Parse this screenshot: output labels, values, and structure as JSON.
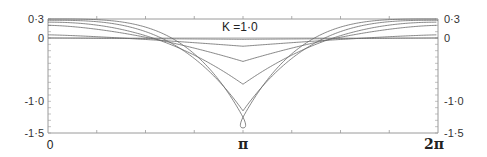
{
  "chart_data": {
    "type": "line",
    "title": "",
    "annotation": "K =1·0",
    "xlabel": "",
    "ylabel": "",
    "x_range": [
      0,
      6.2832
    ],
    "ylim": [
      -1.5,
      0.3
    ],
    "grid": false,
    "legend": "none",
    "x_ticks": [
      {
        "value": 0,
        "label": "0"
      },
      {
        "value": 3.1416,
        "label": "π"
      },
      {
        "value": 6.2832,
        "label": "2π"
      }
    ],
    "y_ticks_left": [
      {
        "value": 0.3,
        "label": "0·3"
      },
      {
        "value": 0,
        "label": "0"
      },
      {
        "value": -1.0,
        "label": "-1·0"
      },
      {
        "value": -1.5,
        "label": "-1·5"
      }
    ],
    "y_ticks_right": [
      {
        "value": 0.3,
        "label": "0·3"
      },
      {
        "value": 0,
        "label": "0"
      },
      {
        "value": -1.0,
        "label": "-1·0"
      },
      {
        "value": -1.5,
        "label": "-1·5"
      }
    ],
    "series": [
      {
        "name": "curve-1",
        "edge": 0.0,
        "center": -0.02,
        "sharpness": 1.0
      },
      {
        "name": "curve-2",
        "edge": 0.05,
        "center": -0.13,
        "sharpness": 1.3
      },
      {
        "name": "curve-3",
        "edge": 0.2,
        "center": -0.37,
        "sharpness": 1.6
      },
      {
        "name": "curve-4",
        "edge": 0.25,
        "center": -0.73,
        "sharpness": 2.2
      },
      {
        "name": "curve-5",
        "edge": 0.28,
        "center": -1.15,
        "sharpness": 3.0
      },
      {
        "name": "curve-6",
        "edge": 0.3,
        "center": -1.25,
        "sharpness": 3.6,
        "loop_bottom": -1.42
      }
    ]
  },
  "colors": {
    "axis": "#9a9a9a",
    "curve": "#6a6a6a",
    "text": "#222222"
  }
}
